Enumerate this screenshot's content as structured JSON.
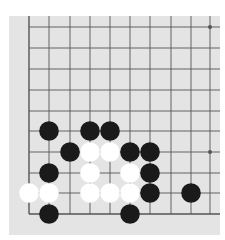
{
  "board": {
    "background": "#e4e4e4",
    "line_color": "#555555",
    "black_color": "#1a1a1a",
    "white_color": "#ffffff",
    "columns_x": [
      20,
      40,
      61,
      81,
      101,
      121,
      141,
      162,
      182,
      201
    ],
    "rows_y": [
      11,
      32,
      53,
      74,
      95,
      115,
      136,
      157,
      177,
      198
    ],
    "star_points": [
      [
        9,
        0
      ],
      [
        9,
        6
      ]
    ],
    "stones": [
      {
        "color": "black",
        "col": 1,
        "row": 5
      },
      {
        "color": "black",
        "col": 3,
        "row": 5
      },
      {
        "color": "black",
        "col": 4,
        "row": 5
      },
      {
        "color": "black",
        "col": 2,
        "row": 6
      },
      {
        "color": "white",
        "col": 3,
        "row": 6
      },
      {
        "color": "white",
        "col": 4,
        "row": 6
      },
      {
        "color": "black",
        "col": 5,
        "row": 6
      },
      {
        "color": "black",
        "col": 6,
        "row": 6
      },
      {
        "color": "black",
        "col": 1,
        "row": 7
      },
      {
        "color": "white",
        "col": 3,
        "row": 7
      },
      {
        "color": "white",
        "col": 5,
        "row": 7
      },
      {
        "color": "black",
        "col": 6,
        "row": 7
      },
      {
        "color": "white",
        "col": 0,
        "row": 8
      },
      {
        "color": "white",
        "col": 1,
        "row": 8
      },
      {
        "color": "white",
        "col": 3,
        "row": 8
      },
      {
        "color": "white",
        "col": 4,
        "row": 8
      },
      {
        "color": "white",
        "col": 5,
        "row": 8
      },
      {
        "color": "black",
        "col": 6,
        "row": 8
      },
      {
        "color": "black",
        "col": 8,
        "row": 8
      },
      {
        "color": "black",
        "col": 1,
        "row": 9
      },
      {
        "color": "black",
        "col": 5,
        "row": 9
      }
    ]
  }
}
